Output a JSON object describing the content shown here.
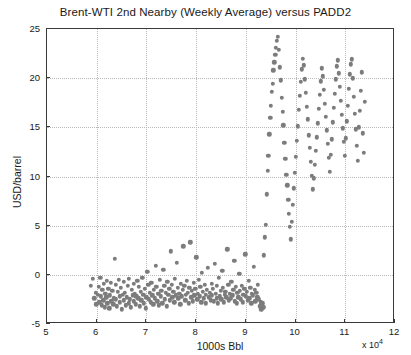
{
  "chart_data": {
    "type": "scatter",
    "title": "Brent-WTI 2nd Nearby (Weekly Average) versus PADD2",
    "xlabel": "1000s Bbl",
    "ylabel": "USD/barrel",
    "x_multiplier_text": "x 10",
    "x_multiplier_exponent": "4",
    "xlim": [
      5,
      12
    ],
    "ylim": [
      -5,
      25
    ],
    "xticks": [
      5,
      6,
      7,
      8,
      9,
      10,
      11,
      12
    ],
    "yticks": [
      -5,
      0,
      5,
      10,
      15,
      20,
      25
    ],
    "grid": true,
    "legend": "none",
    "marker_color": "#7c7c7c",
    "points": [
      [
        5.88,
        -1.1
      ],
      [
        5.92,
        -0.4
      ],
      [
        5.95,
        -2.4
      ],
      [
        5.98,
        -1.8
      ],
      [
        5.99,
        -3.0
      ],
      [
        6.02,
        -2.0
      ],
      [
        6.04,
        -1.2
      ],
      [
        6.05,
        -2.8
      ],
      [
        6.07,
        -0.3
      ],
      [
        6.08,
        -2.2
      ],
      [
        6.1,
        -3.1
      ],
      [
        6.11,
        -1.5
      ],
      [
        6.13,
        -2.6
      ],
      [
        6.14,
        -0.9
      ],
      [
        6.16,
        -3.3
      ],
      [
        6.17,
        -1.9
      ],
      [
        6.19,
        -2.3
      ],
      [
        6.2,
        -0.6
      ],
      [
        6.21,
        -2.9
      ],
      [
        6.23,
        -1.4
      ],
      [
        6.25,
        -3.4
      ],
      [
        6.26,
        -2.1
      ],
      [
        6.28,
        -0.8
      ],
      [
        6.29,
        -2.7
      ],
      [
        6.31,
        -1.6
      ],
      [
        6.33,
        -3.0
      ],
      [
        6.34,
        -2.4
      ],
      [
        6.36,
        1.6
      ],
      [
        6.38,
        -1.0
      ],
      [
        6.39,
        -2.5
      ],
      [
        6.41,
        -3.2
      ],
      [
        6.42,
        -1.7
      ],
      [
        6.44,
        -0.5
      ],
      [
        6.46,
        -2.2
      ],
      [
        6.47,
        -2.8
      ],
      [
        6.49,
        -1.3
      ],
      [
        6.51,
        -3.5
      ],
      [
        6.52,
        -2.0
      ],
      [
        6.54,
        -0.7
      ],
      [
        6.55,
        -2.6
      ],
      [
        6.57,
        -1.8
      ],
      [
        6.59,
        -3.1
      ],
      [
        6.6,
        -2.3
      ],
      [
        6.62,
        -1.1
      ],
      [
        6.64,
        -2.9
      ],
      [
        6.65,
        -0.4
      ],
      [
        6.67,
        -2.5
      ],
      [
        6.69,
        -3.3
      ],
      [
        6.7,
        -1.5
      ],
      [
        6.72,
        -2.1
      ],
      [
        6.74,
        -0.9
      ],
      [
        6.75,
        -2.7
      ],
      [
        6.77,
        -1.9
      ],
      [
        6.79,
        -3.0
      ],
      [
        6.8,
        -2.2
      ],
      [
        6.82,
        -0.6
      ],
      [
        6.84,
        -2.4
      ],
      [
        6.85,
        -1.2
      ],
      [
        6.87,
        -3.2
      ],
      [
        6.89,
        -1.7
      ],
      [
        6.9,
        -2.6
      ],
      [
        6.92,
        -0.3
      ],
      [
        6.94,
        -2.0
      ],
      [
        6.95,
        -2.9
      ],
      [
        6.97,
        -1.4
      ],
      [
        6.99,
        -3.4
      ],
      [
        7.0,
        -2.3
      ],
      [
        7.02,
        0.3
      ],
      [
        7.04,
        -1.0
      ],
      [
        7.05,
        -2.5
      ],
      [
        7.07,
        -1.8
      ],
      [
        7.09,
        -2.8
      ],
      [
        7.1,
        -0.8
      ],
      [
        7.12,
        -2.1
      ],
      [
        7.14,
        -3.0
      ],
      [
        7.15,
        -1.5
      ],
      [
        7.17,
        -2.4
      ],
      [
        7.19,
        0.9
      ],
      [
        7.2,
        -1.2
      ],
      [
        7.22,
        -2.7
      ],
      [
        7.24,
        -1.9
      ],
      [
        7.25,
        -3.1
      ],
      [
        7.27,
        -0.5
      ],
      [
        7.29,
        -2.2
      ],
      [
        7.3,
        -1.6
      ],
      [
        7.32,
        -2.9
      ],
      [
        7.34,
        0.5
      ],
      [
        7.36,
        -1.1
      ],
      [
        7.37,
        -2.5
      ],
      [
        7.39,
        -1.8
      ],
      [
        7.41,
        -3.2
      ],
      [
        7.42,
        -0.7
      ],
      [
        7.44,
        -2.0
      ],
      [
        7.46,
        -1.4
      ],
      [
        7.47,
        -2.6
      ],
      [
        7.49,
        2.4
      ],
      [
        7.51,
        -1.0
      ],
      [
        7.52,
        -2.3
      ],
      [
        7.54,
        -1.7
      ],
      [
        7.56,
        -2.8
      ],
      [
        7.57,
        -0.4
      ],
      [
        7.59,
        -2.1
      ],
      [
        7.61,
        1.2
      ],
      [
        7.63,
        -1.3
      ],
      [
        7.64,
        -2.4
      ],
      [
        7.66,
        -1.9
      ],
      [
        7.68,
        -3.0
      ],
      [
        7.69,
        -0.9
      ],
      [
        7.71,
        -2.2
      ],
      [
        7.73,
        -1.5
      ],
      [
        7.74,
        2.9
      ],
      [
        7.76,
        -1.1
      ],
      [
        7.78,
        -2.6
      ],
      [
        7.79,
        -2.0
      ],
      [
        7.81,
        -0.6
      ],
      [
        7.83,
        -1.8
      ],
      [
        7.85,
        -2.9
      ],
      [
        7.86,
        -1.3
      ],
      [
        7.88,
        3.3
      ],
      [
        7.9,
        -2.3
      ],
      [
        7.91,
        -1.6
      ],
      [
        7.93,
        -2.7
      ],
      [
        7.95,
        -0.8
      ],
      [
        7.96,
        -2.1
      ],
      [
        7.98,
        -1.4
      ],
      [
        8.0,
        1.8
      ],
      [
        8.02,
        -2.5
      ],
      [
        8.03,
        -1.9
      ],
      [
        8.05,
        -0.5
      ],
      [
        8.07,
        -2.2
      ],
      [
        8.08,
        -1.2
      ],
      [
        8.1,
        -2.8
      ],
      [
        8.12,
        0.2
      ],
      [
        8.14,
        -1.7
      ],
      [
        8.15,
        -2.4
      ],
      [
        8.17,
        -1.0
      ],
      [
        8.19,
        -2.0
      ],
      [
        8.2,
        -2.9
      ],
      [
        8.22,
        -1.5
      ],
      [
        8.24,
        0.7
      ],
      [
        8.25,
        -2.3
      ],
      [
        8.27,
        -1.8
      ],
      [
        8.29,
        -2.6
      ],
      [
        8.31,
        -0.9
      ],
      [
        8.32,
        -2.1
      ],
      [
        8.34,
        -1.4
      ],
      [
        8.36,
        -2.7
      ],
      [
        8.37,
        1.1
      ],
      [
        8.39,
        -1.9
      ],
      [
        8.41,
        -2.4
      ],
      [
        8.42,
        -1.1
      ],
      [
        8.44,
        -2.9
      ],
      [
        8.46,
        -0.3
      ],
      [
        8.48,
        -2.2
      ],
      [
        8.49,
        -1.6
      ],
      [
        8.51,
        -2.5
      ],
      [
        8.53,
        0.4
      ],
      [
        8.54,
        -1.3
      ],
      [
        8.56,
        -2.8
      ],
      [
        8.58,
        -2.0
      ],
      [
        8.59,
        -1.7
      ],
      [
        8.61,
        -2.3
      ],
      [
        8.63,
        2.6
      ],
      [
        8.65,
        -1.0
      ],
      [
        8.66,
        -2.6
      ],
      [
        8.68,
        -1.9
      ],
      [
        8.7,
        -2.4
      ],
      [
        8.71,
        -0.7
      ],
      [
        8.73,
        -2.1
      ],
      [
        8.75,
        -1.5
      ],
      [
        8.77,
        1.4
      ],
      [
        8.78,
        -2.7
      ],
      [
        8.8,
        -1.2
      ],
      [
        8.82,
        -2.9
      ],
      [
        8.83,
        -1.8
      ],
      [
        8.85,
        -2.3
      ],
      [
        8.87,
        0.1
      ],
      [
        8.88,
        -1.6
      ],
      [
        8.9,
        -2.5
      ],
      [
        8.92,
        -1.1
      ],
      [
        8.94,
        -2.8
      ],
      [
        8.95,
        -2.0
      ],
      [
        8.97,
        -1.4
      ],
      [
        8.99,
        2.1
      ],
      [
        9.0,
        -2.2
      ],
      [
        9.02,
        -1.7
      ],
      [
        9.04,
        -2.6
      ],
      [
        9.06,
        -0.6
      ],
      [
        9.07,
        -2.4
      ],
      [
        9.09,
        -1.3
      ],
      [
        9.11,
        -2.9
      ],
      [
        9.12,
        -1.9
      ],
      [
        9.14,
        -2.1
      ],
      [
        9.16,
        0.8
      ],
      [
        9.18,
        -1.5
      ],
      [
        9.19,
        -2.7
      ],
      [
        9.21,
        -1.8
      ],
      [
        9.23,
        -2.3
      ],
      [
        9.24,
        -1.0
      ],
      [
        9.26,
        -2.5
      ],
      [
        9.28,
        -3.2
      ],
      [
        9.3,
        -2.8
      ],
      [
        9.31,
        -3.5
      ],
      [
        9.33,
        -2.9
      ],
      [
        9.35,
        -3.3
      ],
      [
        9.36,
        2.0
      ],
      [
        9.38,
        3.8
      ],
      [
        9.4,
        5.1
      ],
      [
        9.42,
        8.2
      ],
      [
        9.44,
        10.6
      ],
      [
        9.45,
        12.1
      ],
      [
        9.47,
        14.3
      ],
      [
        9.49,
        16.0
      ],
      [
        9.5,
        17.2
      ],
      [
        9.52,
        18.6
      ],
      [
        9.54,
        19.4
      ],
      [
        9.55,
        20.8
      ],
      [
        9.57,
        21.6
      ],
      [
        9.59,
        22.4
      ],
      [
        9.6,
        23.1
      ],
      [
        9.62,
        23.8
      ],
      [
        9.64,
        24.2
      ],
      [
        9.66,
        22.9
      ],
      [
        9.68,
        21.1
      ],
      [
        9.7,
        19.8
      ],
      [
        9.72,
        18.0
      ],
      [
        9.74,
        16.6
      ],
      [
        9.75,
        15.2
      ],
      [
        9.77,
        13.4
      ],
      [
        9.79,
        11.8
      ],
      [
        9.81,
        10.2
      ],
      [
        9.83,
        9.1
      ],
      [
        9.85,
        7.6
      ],
      [
        9.87,
        6.2
      ],
      [
        9.89,
        4.9
      ],
      [
        9.91,
        3.6
      ],
      [
        9.93,
        5.4
      ],
      [
        9.95,
        7.1
      ],
      [
        9.97,
        8.8
      ],
      [
        9.99,
        10.4
      ],
      [
        10.01,
        12.0
      ],
      [
        10.03,
        13.6
      ],
      [
        10.05,
        15.1
      ],
      [
        10.07,
        16.8
      ],
      [
        10.09,
        18.2
      ],
      [
        10.11,
        19.6
      ],
      [
        10.13,
        20.9
      ],
      [
        10.15,
        22.0
      ],
      [
        10.17,
        21.3
      ],
      [
        10.19,
        19.9
      ],
      [
        10.21,
        18.5
      ],
      [
        10.23,
        17.1
      ],
      [
        10.25,
        15.8
      ],
      [
        10.27,
        14.2
      ],
      [
        10.29,
        12.9
      ],
      [
        10.31,
        11.5
      ],
      [
        10.33,
        10.1
      ],
      [
        10.35,
        8.7
      ],
      [
        10.37,
        9.8
      ],
      [
        10.39,
        11.2
      ],
      [
        10.41,
        12.6
      ],
      [
        10.43,
        14.0
      ],
      [
        10.45,
        15.4
      ],
      [
        10.47,
        16.9
      ],
      [
        10.49,
        18.3
      ],
      [
        10.51,
        19.7
      ],
      [
        10.53,
        21.0
      ],
      [
        10.55,
        20.2
      ],
      [
        10.57,
        18.8
      ],
      [
        10.59,
        17.4
      ],
      [
        10.61,
        16.1
      ],
      [
        10.63,
        14.7
      ],
      [
        10.65,
        13.3
      ],
      [
        10.67,
        11.9
      ],
      [
        10.69,
        10.5
      ],
      [
        10.71,
        12.2
      ],
      [
        10.73,
        13.8
      ],
      [
        10.75,
        15.5
      ],
      [
        10.77,
        17.0
      ],
      [
        10.79,
        18.4
      ],
      [
        10.81,
        19.9
      ],
      [
        10.83,
        21.2
      ],
      [
        10.85,
        21.8
      ],
      [
        10.87,
        20.5
      ],
      [
        10.89,
        19.1
      ],
      [
        10.91,
        17.7
      ],
      [
        10.93,
        16.3
      ],
      [
        10.95,
        14.9
      ],
      [
        10.97,
        13.5
      ],
      [
        10.99,
        12.1
      ],
      [
        11.01,
        13.9
      ],
      [
        11.03,
        15.6
      ],
      [
        11.05,
        17.2
      ],
      [
        11.07,
        18.9
      ],
      [
        11.09,
        20.4
      ],
      [
        11.11,
        21.4
      ],
      [
        11.13,
        21.9
      ],
      [
        11.15,
        20.0
      ],
      [
        11.17,
        18.1
      ],
      [
        11.19,
        16.4
      ],
      [
        11.21,
        14.8
      ],
      [
        11.23,
        13.1
      ],
      [
        11.25,
        11.6
      ],
      [
        11.27,
        15.0
      ],
      [
        11.29,
        16.7
      ],
      [
        11.31,
        18.7
      ],
      [
        11.33,
        20.6
      ],
      [
        11.35,
        14.4
      ],
      [
        11.37,
        12.4
      ],
      [
        11.39,
        17.6
      ]
    ]
  }
}
